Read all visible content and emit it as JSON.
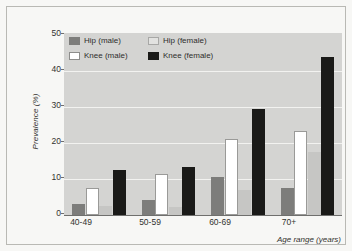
{
  "chart_data": {
    "type": "bar",
    "title": "",
    "xlabel": "Age range (years)",
    "ylabel": "Prevalence (%)",
    "categories": [
      "40-49",
      "50-59",
      "60-69",
      "70+"
    ],
    "ylim": [
      0,
      50
    ],
    "yticks": [
      "0",
      "10",
      "20",
      "30",
      "40",
      "50"
    ],
    "grid": true,
    "legend_position": "upper-left-inside",
    "series": [
      {
        "name": "Hip (male)",
        "color": "#7d7d7b",
        "values": [
          3.0,
          4.0,
          10.5,
          7.5
        ]
      },
      {
        "name": "Knee (male)",
        "color": "#ffffff",
        "values": [
          7.5,
          11.2,
          21.0,
          23.0
        ]
      },
      {
        "name": "Hip (female)",
        "color": "#c6c6c4",
        "values": [
          2.5,
          2.2,
          7.0,
          17.2
        ]
      },
      {
        "name": "Knee (female)",
        "color": "#1a1a18",
        "values": [
          12.5,
          13.2,
          29.0,
          43.5
        ]
      }
    ]
  },
  "legend": {
    "items": [
      {
        "label": "Hip (male)"
      },
      {
        "label": "Hip (female)"
      },
      {
        "label": "Knee (male)"
      },
      {
        "label": "Knee (female)"
      }
    ]
  },
  "axes": {
    "y_title": "Prevalence (%)",
    "x_title": "Age range (years)",
    "y_ticks": [
      "50",
      "40",
      "30",
      "20",
      "10",
      "0"
    ],
    "x_ticks": [
      "40-49",
      "50-59",
      "60-69",
      "70+"
    ]
  }
}
